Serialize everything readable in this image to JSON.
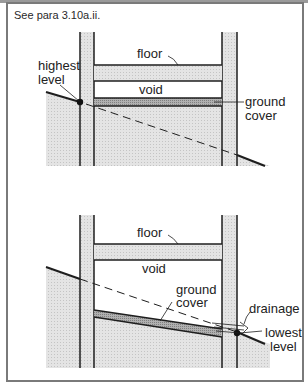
{
  "caption": "See para 3.10a.ii.",
  "diagram_top": {
    "labels": {
      "highest_level_line1": "highest",
      "highest_level_line2": "level",
      "floor": "floor",
      "void": "void",
      "ground_cover_line1": "ground",
      "ground_cover_line2": "cover"
    }
  },
  "diagram_bottom": {
    "labels": {
      "floor": "floor",
      "void": "void",
      "ground_cover_line1": "ground",
      "ground_cover_line2": "cover",
      "drainage": "drainage",
      "lowest_level_line1": "lowest",
      "lowest_level_line2": "level"
    }
  },
  "colors": {
    "line": "#1e1e1e",
    "wall_fill": "#d9d9d9",
    "ground_fill": "#e0e0e0",
    "ground_cover_fill": "#a8a8a8",
    "frame": "#7a7a7a"
  }
}
